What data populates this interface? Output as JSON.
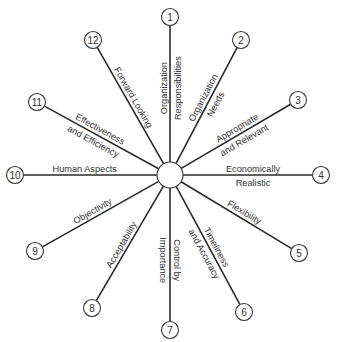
{
  "diagram": {
    "type": "radial-spoke",
    "center": {
      "x": 170,
      "y": 175,
      "r": 13
    },
    "nodes": [
      {
        "num": "1",
        "x": 170,
        "y": 17,
        "label1": "Organization",
        "label2": "Responsibilities"
      },
      {
        "num": "2",
        "x": 241,
        "y": 40,
        "label1": "Organization",
        "label2": "Needs"
      },
      {
        "num": "3",
        "x": 298,
        "y": 100,
        "label1": "Appropriate",
        "label2": "and Relevant"
      },
      {
        "num": "4",
        "x": 321,
        "y": 175,
        "label1": "Economically",
        "label2": "Realistic"
      },
      {
        "num": "5",
        "x": 299,
        "y": 253,
        "label1": "Flexibility",
        "label2": ""
      },
      {
        "num": "6",
        "x": 244,
        "y": 312,
        "label1": "Timeliness",
        "label2": "and Accuracy"
      },
      {
        "num": "7",
        "x": 170,
        "y": 330,
        "label1": "Control by",
        "label2": "Importance"
      },
      {
        "num": "8",
        "x": 92,
        "y": 308,
        "label1": "Acceptability",
        "label2": ""
      },
      {
        "num": "9",
        "x": 35,
        "y": 251,
        "label1": "Objectivity",
        "label2": ""
      },
      {
        "num": "10",
        "x": 15,
        "y": 175,
        "label1": "Human Aspects",
        "label2": ""
      },
      {
        "num": "11",
        "x": 37,
        "y": 102,
        "label1": "Effectiveness",
        "label2": "and Efficiency"
      },
      {
        "num": "12",
        "x": 93,
        "y": 40,
        "label1": "Forward Looking",
        "label2": ""
      }
    ]
  }
}
